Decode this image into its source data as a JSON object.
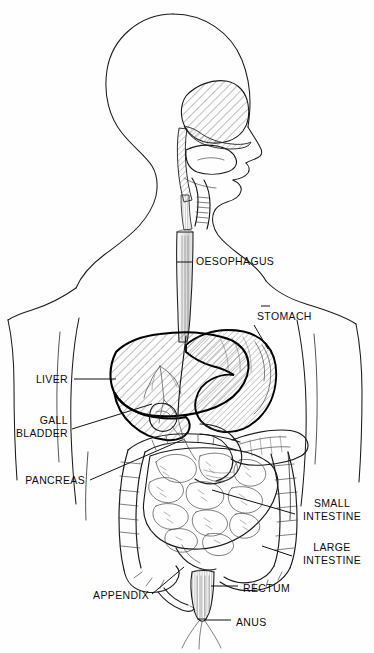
{
  "figure": {
    "name": "human-digestive-system",
    "style": "black and white line drawing, cross-hatched organs, body outline in profile",
    "background_color": "#fefefe",
    "line_color": "#111111"
  },
  "labels": [
    {
      "id": "oesophagus",
      "text": "OESOPHAGUS",
      "lines": [
        "OESOPHAGUS"
      ],
      "align": "start",
      "text_x": 196,
      "text_y": 265,
      "leader": "M 177 262 L 192 262"
    },
    {
      "id": "stomach",
      "text": "STOMACH",
      "lines": [
        "STOMACH"
      ],
      "align": "start",
      "text_x": 257,
      "text_y": 320,
      "leader": "M 254 325 L 268 349",
      "tick": "M 261 306 L 270 306"
    },
    {
      "id": "liver",
      "text": "LIVER",
      "lines": [
        "LIVER"
      ],
      "align": "end",
      "text_x": 68,
      "text_y": 383,
      "leader": "M 74 379 L 116 379"
    },
    {
      "id": "gall-bladder",
      "text": "GALL BLADDER",
      "lines": [
        "GALL",
        "BLADDER"
      ],
      "align": "end",
      "text_x": 68,
      "text_y": 424,
      "leader": "M 72 429 L 152 404"
    },
    {
      "id": "pancreas",
      "text": "PANCREAS",
      "lines": [
        "PANCREAS"
      ],
      "align": "end",
      "text_x": 85,
      "text_y": 484,
      "leader": "M 90 480 L 182 440"
    },
    {
      "id": "small-intestine",
      "text": "SMALL INTESTINE",
      "lines": [
        "SMALL",
        "INTESTINE"
      ],
      "align": "mid",
      "text_x": 332,
      "text_y": 507,
      "leader": "M 295 514 L 212 490"
    },
    {
      "id": "large-intestine",
      "text": "LARGE INTESTINE",
      "lines": [
        "LARGE",
        "INTESTINE"
      ],
      "align": "mid",
      "text_x": 332,
      "text_y": 551,
      "leader": "M 292 556 L 262 546"
    },
    {
      "id": "rectum",
      "text": "RECTUM",
      "lines": [
        "RECTUM"
      ],
      "align": "start",
      "text_x": 243,
      "text_y": 592,
      "leader": "M 211 586 L 238 586"
    },
    {
      "id": "appendix",
      "text": "APPENDIX",
      "lines": [
        "APPENDIX"
      ],
      "align": "end",
      "text_x": 149,
      "text_y": 599,
      "leader": "M 152 594 L 184 567"
    },
    {
      "id": "anus",
      "text": "ANUS",
      "lines": [
        "ANUS"
      ],
      "align": "start",
      "text_x": 236,
      "text_y": 626,
      "leader": "M 204 620 L 231 620"
    }
  ],
  "organs": [
    {
      "id": "oral-nasal-cavity",
      "name": "oral and nasal cavity",
      "shading": "diagonal-hatch"
    },
    {
      "id": "tongue",
      "name": "tongue",
      "shading": "outline"
    },
    {
      "id": "trachea",
      "name": "trachea",
      "shading": "ringed"
    },
    {
      "id": "oesophagus-tube",
      "name": "oesophagus",
      "shading": "vertical-shading"
    },
    {
      "id": "liver-organ",
      "name": "liver",
      "shading": "diagonal-hatch"
    },
    {
      "id": "gall-bladder-organ",
      "name": "gall bladder",
      "shading": "outline"
    },
    {
      "id": "stomach-organ",
      "name": "stomach",
      "shading": "diagonal-hatch"
    },
    {
      "id": "pancreas-organ",
      "name": "pancreas",
      "shading": "stipple"
    },
    {
      "id": "small-intestine-organ",
      "name": "small intestine",
      "shading": "coiled-loops"
    },
    {
      "id": "large-intestine-organ",
      "name": "large intestine",
      "shading": "haustrated-frame"
    },
    {
      "id": "appendix-organ",
      "name": "appendix",
      "shading": "outline"
    },
    {
      "id": "rectum-organ",
      "name": "rectum",
      "shading": "vertical-shading"
    },
    {
      "id": "anus-organ",
      "name": "anus",
      "shading": "outline"
    }
  ]
}
